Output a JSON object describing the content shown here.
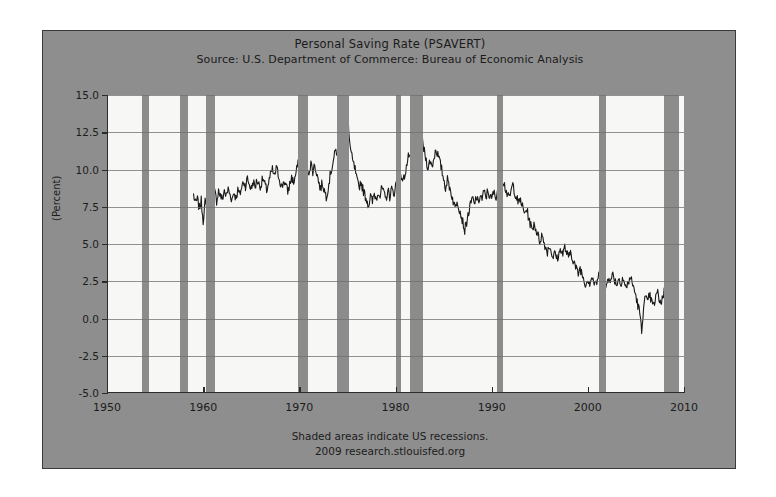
{
  "chart_data": {
    "type": "line",
    "title": "Personal Saving Rate (PSAVERT)",
    "subtitle": "Source: U.S. Department of Commerce: Bureau of Economic Analysis",
    "xlabel": "",
    "ylabel": "(Percent)",
    "xlim": [
      1950,
      2010
    ],
    "ylim": [
      -5.0,
      15.0
    ],
    "grid": true,
    "legend": "none",
    "xticks": [
      "1950",
      "1960",
      "1970",
      "1980",
      "1990",
      "2000",
      "2010"
    ],
    "xtick_values": [
      1950,
      1960,
      1970,
      1980,
      1990,
      2000,
      2010
    ],
    "yticks": [
      "15.0",
      "12.5",
      "10.0",
      "7.5",
      "5.0",
      "2.5",
      "0.0",
      "-2.5",
      "-5.0"
    ],
    "ytick_values": [
      15.0,
      12.5,
      10.0,
      7.5,
      5.0,
      2.5,
      0.0,
      -2.5,
      -5.0
    ],
    "series_name": "Personal Saving Rate",
    "series_color": "#1a1a1a",
    "recession_color": "#8c8c8c",
    "plot_background": "#f7f7f5",
    "panel_background": "#8e8e8e",
    "annotations": [
      "Shaded areas indicate US recessions.",
      "2009 research.stlouisfed.org"
    ],
    "recessions": [
      {
        "start": 1953.6,
        "end": 1954.4
      },
      {
        "start": 1957.6,
        "end": 1958.4
      },
      {
        "start": 1960.3,
        "end": 1961.2
      },
      {
        "start": 1969.9,
        "end": 1970.9
      },
      {
        "start": 1973.9,
        "end": 1975.2
      },
      {
        "start": 1980.0,
        "end": 1980.6
      },
      {
        "start": 1981.5,
        "end": 1982.9
      },
      {
        "start": 1990.6,
        "end": 1991.2
      },
      {
        "start": 2001.2,
        "end": 2001.9
      },
      {
        "start": 2007.9,
        "end": 2009.5
      }
    ],
    "x": [
      1959.0,
      1959.2,
      1959.4,
      1959.6,
      1959.8,
      1960.0,
      1960.2,
      1960.4,
      1960.6,
      1960.8,
      1961.0,
      1961.2,
      1961.4,
      1961.6,
      1961.8,
      1962.0,
      1962.2,
      1962.4,
      1962.6,
      1962.8,
      1963.0,
      1963.2,
      1963.4,
      1963.6,
      1963.8,
      1964.0,
      1964.2,
      1964.4,
      1964.6,
      1964.8,
      1965.0,
      1965.2,
      1965.4,
      1965.6,
      1965.8,
      1966.0,
      1966.2,
      1966.4,
      1966.6,
      1966.8,
      1967.0,
      1967.2,
      1967.4,
      1967.6,
      1967.8,
      1968.0,
      1968.2,
      1968.4,
      1968.6,
      1968.8,
      1969.0,
      1969.2,
      1969.4,
      1969.6,
      1969.8,
      1970.0,
      1970.2,
      1970.4,
      1970.6,
      1970.8,
      1971.0,
      1971.2,
      1971.4,
      1971.6,
      1971.8,
      1972.0,
      1972.2,
      1972.4,
      1972.6,
      1972.8,
      1973.0,
      1973.2,
      1973.4,
      1973.6,
      1973.8,
      1974.0,
      1974.2,
      1974.4,
      1974.6,
      1974.8,
      1975.0,
      1975.2,
      1975.4,
      1975.6,
      1975.8,
      1976.0,
      1976.2,
      1976.4,
      1976.6,
      1976.8,
      1977.0,
      1977.2,
      1977.4,
      1977.6,
      1977.8,
      1978.0,
      1978.2,
      1978.4,
      1978.6,
      1978.8,
      1979.0,
      1979.2,
      1979.4,
      1979.6,
      1979.8,
      1980.0,
      1980.2,
      1980.4,
      1980.6,
      1980.8,
      1981.0,
      1981.2,
      1981.4,
      1981.6,
      1981.8,
      1982.0,
      1982.2,
      1982.4,
      1982.6,
      1982.8,
      1983.0,
      1983.2,
      1983.4,
      1983.6,
      1983.8,
      1984.0,
      1984.2,
      1984.4,
      1984.6,
      1984.8,
      1985.0,
      1985.2,
      1985.4,
      1985.6,
      1985.8,
      1986.0,
      1986.2,
      1986.4,
      1986.6,
      1986.8,
      1987.0,
      1987.2,
      1987.4,
      1987.6,
      1987.8,
      1988.0,
      1988.2,
      1988.4,
      1988.6,
      1988.8,
      1989.0,
      1989.2,
      1989.4,
      1989.6,
      1989.8,
      1990.0,
      1990.2,
      1990.4,
      1990.6,
      1990.8,
      1991.0,
      1991.2,
      1991.4,
      1991.6,
      1991.8,
      1992.0,
      1992.2,
      1992.4,
      1992.6,
      1992.8,
      1993.0,
      1993.2,
      1993.4,
      1993.6,
      1993.8,
      1994.0,
      1994.2,
      1994.4,
      1994.6,
      1994.8,
      1995.0,
      1995.2,
      1995.4,
      1995.6,
      1995.8,
      1996.0,
      1996.2,
      1996.4,
      1996.6,
      1996.8,
      1997.0,
      1997.2,
      1997.4,
      1997.6,
      1997.8,
      1998.0,
      1998.2,
      1998.4,
      1998.6,
      1998.8,
      1999.0,
      1999.2,
      1999.4,
      1999.6,
      1999.8,
      2000.0,
      2000.2,
      2000.4,
      2000.6,
      2000.8,
      2001.0,
      2001.2,
      2001.4,
      2001.6,
      2001.8,
      2002.0,
      2002.2,
      2002.4,
      2002.6,
      2002.8,
      2003.0,
      2003.2,
      2003.4,
      2003.6,
      2003.8,
      2004.0,
      2004.2,
      2004.4,
      2004.6,
      2004.8,
      2005.0,
      2005.2,
      2005.4,
      2005.6,
      2005.8,
      2006.0,
      2006.2,
      2006.4,
      2006.6,
      2006.8,
      2007.0,
      2007.2,
      2007.4,
      2007.6,
      2007.8,
      2008.0,
      2008.2,
      2008.4,
      2008.6,
      2008.8,
      2009.0,
      2009.2,
      2009.4
    ],
    "y": [
      8.3,
      7.7,
      8.0,
      7.4,
      7.9,
      6.6,
      7.8,
      7.2,
      8.0,
      7.6,
      7.1,
      8.5,
      7.9,
      8.6,
      8.2,
      8.0,
      8.6,
      8.2,
      8.7,
      8.3,
      8.0,
      8.5,
      8.1,
      8.6,
      8.3,
      8.8,
      9.2,
      8.9,
      9.4,
      9.0,
      8.7,
      9.2,
      8.8,
      9.3,
      9.0,
      8.9,
      9.4,
      9.0,
      8.6,
      9.1,
      9.6,
      10.0,
      9.5,
      10.1,
      9.7,
      9.2,
      8.8,
      9.3,
      8.9,
      8.5,
      9.0,
      9.5,
      9.1,
      9.6,
      10.2,
      10.6,
      10.1,
      10.5,
      10.0,
      9.6,
      9.9,
      10.4,
      9.9,
      10.3,
      9.8,
      9.2,
      8.7,
      9.1,
      8.6,
      8.2,
      8.8,
      9.6,
      10.2,
      10.8,
      11.3,
      11.0,
      11.6,
      12.2,
      11.7,
      12.6,
      14.6,
      12.0,
      11.0,
      10.4,
      10.0,
      9.2,
      8.8,
      9.2,
      8.7,
      8.3,
      8.0,
      7.6,
      8.2,
      7.8,
      8.4,
      8.0,
      8.6,
      8.2,
      8.8,
      8.3,
      8.0,
      8.6,
      8.2,
      8.7,
      8.3,
      8.9,
      9.4,
      9.0,
      9.6,
      9.2,
      9.8,
      10.4,
      11.0,
      10.5,
      11.2,
      11.8,
      12.1,
      11.6,
      12.3,
      11.8,
      11.2,
      10.6,
      10.1,
      10.6,
      10.2,
      10.8,
      11.4,
      11.0,
      10.5,
      10.0,
      9.4,
      8.8,
      9.3,
      8.9,
      8.4,
      7.9,
      7.4,
      8.0,
      7.5,
      7.0,
      6.5,
      5.9,
      6.5,
      7.1,
      7.6,
      8.1,
      7.6,
      8.2,
      7.7,
      8.3,
      8.0,
      8.5,
      8.1,
      8.6,
      8.2,
      8.0,
      8.5,
      8.1,
      8.6,
      8.2,
      8.9,
      9.3,
      8.8,
      8.4,
      8.0,
      8.5,
      9.0,
      8.5,
      8.1,
      7.7,
      8.0,
      7.5,
      7.0,
      7.4,
      6.9,
      6.4,
      5.9,
      6.4,
      6.0,
      5.6,
      5.2,
      5.6,
      5.2,
      4.8,
      4.5,
      4.9,
      4.5,
      4.1,
      4.4,
      4.0,
      4.3,
      4.7,
      4.3,
      4.8,
      4.4,
      4.0,
      4.5,
      4.1,
      3.7,
      3.3,
      3.0,
      3.4,
      3.0,
      2.6,
      2.3,
      2.7,
      2.4,
      2.8,
      2.5,
      2.2,
      2.6,
      3.0,
      4.8,
      2.4,
      2.0,
      2.4,
      2.9,
      2.5,
      3.0,
      2.6,
      2.3,
      2.7,
      2.3,
      2.8,
      2.4,
      2.0,
      2.4,
      2.8,
      2.4,
      2.0,
      1.5,
      0.9,
      0.4,
      -1.0,
      1.0,
      1.4,
      1.0,
      1.6,
      1.2,
      0.8,
      1.2,
      1.8,
      1.4,
      1.0,
      1.5,
      2.0,
      1.6,
      2.1,
      1.7,
      4.8,
      3.2,
      4.1,
      4.5
    ]
  }
}
